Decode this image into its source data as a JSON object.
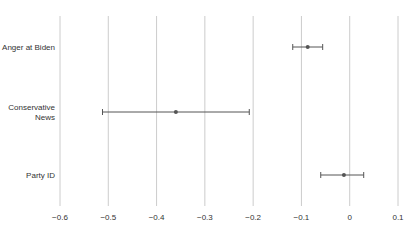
{
  "chart_data": {
    "type": "scatter",
    "subtype": "coefficient-plot",
    "title": "",
    "xlabel": "",
    "ylabel": "",
    "xlim": [
      -0.6,
      0.1
    ],
    "xticks": [
      -0.6,
      -0.5,
      -0.4,
      -0.3,
      -0.2,
      -0.1,
      0,
      0.1
    ],
    "xtick_labels": [
      "−0.6",
      "−0.5",
      "−0.4",
      "−0.3",
      "−0.2",
      "−0.1",
      "0",
      "0.1"
    ],
    "grid": {
      "vertical": true,
      "horizontal": false
    },
    "legend": null,
    "categories": [
      "Anger at Biden",
      "Conservative News",
      "Party ID"
    ],
    "category_label_lines": [
      [
        "Anger at Biden"
      ],
      [
        "Conservative",
        "News"
      ],
      [
        "Party ID"
      ]
    ],
    "estimates": [
      -0.087,
      -0.36,
      -0.012
    ],
    "ci_lower": [
      -0.118,
      -0.512,
      -0.06
    ],
    "ci_upper": [
      -0.056,
      -0.208,
      0.029
    ]
  },
  "colors": {
    "point": "#555555",
    "errorbar": "#555555",
    "grid": "#cccccc",
    "text": "#333333"
  }
}
